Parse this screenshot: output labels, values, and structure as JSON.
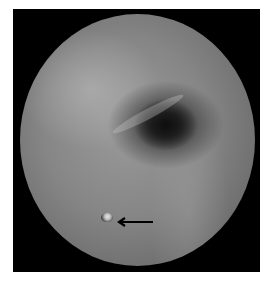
{
  "image": {
    "description": "Circular endoscopic grayscale view of a lumen with a dark tubular opening at upper-right center and a small bright lesion indicated by an arrow at lower-left",
    "annotation": {
      "type": "arrow",
      "direction": "left",
      "target": "small-lesion"
    },
    "colors": {
      "frame": "#000000",
      "background": "#ffffff",
      "lumen": "#141414",
      "mucosa": "#8a8a8a"
    }
  },
  "caption": ""
}
